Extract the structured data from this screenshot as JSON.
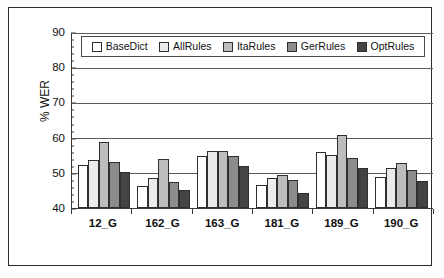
{
  "figure": {
    "has_outer_frame": true,
    "background_color": "#ffffff"
  },
  "chart_data": {
    "type": "bar",
    "title": "",
    "xlabel": "",
    "ylabel": "% WER",
    "ylim": [
      40,
      90
    ],
    "ytick_values": [
      40,
      50,
      60,
      70,
      80,
      90
    ],
    "ytick_labels": [
      "40",
      "50",
      "60",
      "70",
      "80",
      "90"
    ],
    "grid": true,
    "grid_axis": "y",
    "legend_position": "upper-center-inside",
    "categories": [
      "12_G",
      "162_G",
      "163_G",
      "181_G",
      "189_G",
      "190_G"
    ],
    "series": [
      {
        "name": "BaseDict",
        "color": "#ffffff",
        "values": [
          52.3,
          46.3,
          54.7,
          46.5,
          56.0,
          48.7
        ]
      },
      {
        "name": "AllRules",
        "color": "#ebebeb",
        "values": [
          53.5,
          48.5,
          56.3,
          48.5,
          55.1,
          51.3
        ]
      },
      {
        "name": "ItaRules",
        "color": "#bdbdbd",
        "values": [
          58.7,
          54.0,
          56.1,
          49.4,
          60.8,
          52.8
        ]
      },
      {
        "name": "GerRules",
        "color": "#8c8c8c",
        "values": [
          53.1,
          47.5,
          54.9,
          48.0,
          54.2,
          50.7
        ]
      },
      {
        "name": "OptRules",
        "color": "#444444",
        "values": [
          50.1,
          45.2,
          51.8,
          44.2,
          51.5,
          47.7
        ]
      }
    ]
  }
}
